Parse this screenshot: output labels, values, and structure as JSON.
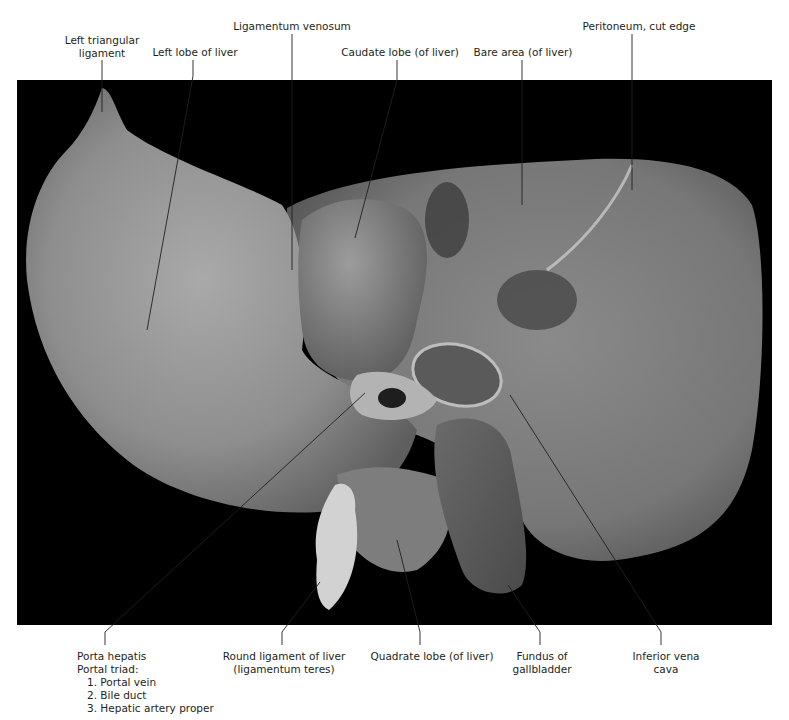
{
  "figure": {
    "background_color": "#000000",
    "label_color": "#231f20",
    "leader_color": "#231f20"
  },
  "labels_top": [
    {
      "id": "left-triangular-ligament",
      "lines": [
        "Left triangular",
        "ligament"
      ]
    },
    {
      "id": "left-lobe-of-liver",
      "lines": [
        "Left lobe of liver"
      ]
    },
    {
      "id": "ligamentum-venosum",
      "lines": [
        "Ligamentum venosum"
      ]
    },
    {
      "id": "caudate-lobe",
      "lines": [
        "Caudate lobe (of liver)"
      ]
    },
    {
      "id": "bare-area",
      "lines": [
        "Bare area (of liver)"
      ]
    },
    {
      "id": "peritoneum-cut-edge",
      "lines": [
        "Peritoneum, cut edge"
      ]
    }
  ],
  "labels_bottom": [
    {
      "id": "porta-hepatis",
      "lines": [
        "Porta hepatis",
        "Portal triad:"
      ],
      "sub_items": [
        "1. Portal vein",
        "2. Bile duct",
        "3. Hepatic artery proper"
      ]
    },
    {
      "id": "round-ligament",
      "lines": [
        "Round ligament of liver",
        "(ligamentum teres)"
      ]
    },
    {
      "id": "quadrate-lobe",
      "lines": [
        "Quadrate lobe (of liver)"
      ]
    },
    {
      "id": "fundus-of-gallbladder",
      "lines": [
        "Fundus of",
        "gallbladder"
      ]
    },
    {
      "id": "inferior-vena-cava",
      "lines": [
        "Inferior vena",
        "cava"
      ]
    }
  ]
}
